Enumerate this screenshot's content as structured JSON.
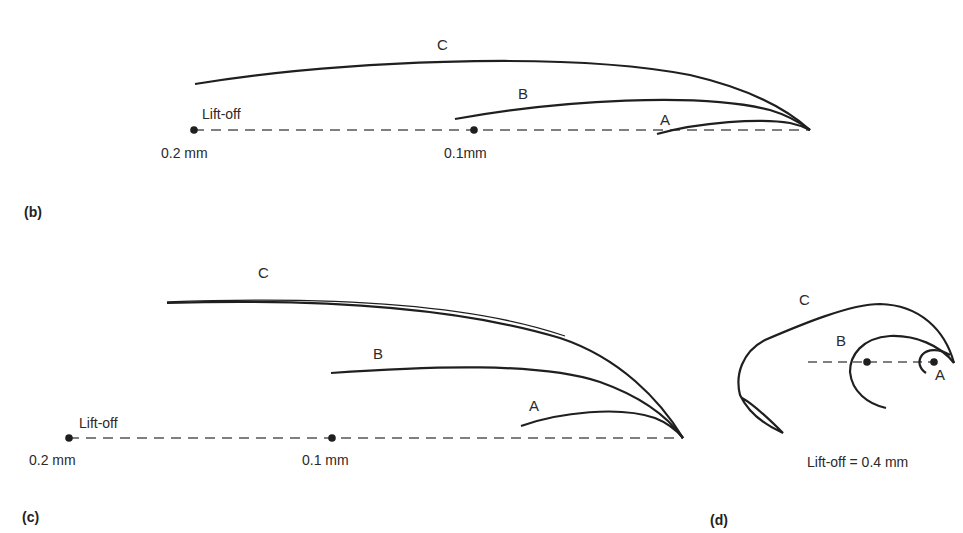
{
  "panels": {
    "b": {
      "label": "(b)",
      "liftoff_text": "Lift-off",
      "marker_far": "0.2 mm",
      "marker_near": "0.1mm",
      "curves": [
        "A",
        "B",
        "C"
      ]
    },
    "c": {
      "label": "(c)",
      "liftoff_text": "Lift-off",
      "marker_far": "0.2 mm",
      "marker_near": "0.1 mm",
      "curves": [
        "A",
        "B",
        "C"
      ]
    },
    "d": {
      "label": "(d)",
      "caption": "Lift-off = 0.4 mm",
      "curves": [
        "A",
        "B",
        "C"
      ]
    }
  },
  "colors": {
    "stroke": "#1f1f1f",
    "dash": "#555555"
  }
}
